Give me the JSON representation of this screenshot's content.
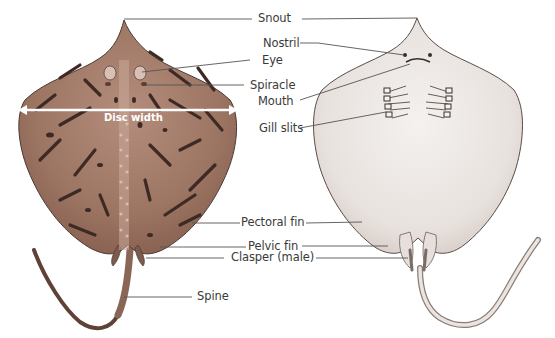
{
  "diagram": {
    "views": [
      "dorsal view",
      "ventral view"
    ],
    "colors": {
      "dorsal_skin": "#9c7563",
      "dorsal_skin_light": "#b99483",
      "dorsal_spots": "#3d2a24",
      "ventral_skin": "#ece7e4",
      "ventral_shade": "#d8cfca",
      "outline": "#4a3a34",
      "leader_line": "#555555",
      "label_text": "#3a3a3a",
      "disc_arrow": "#ffffff"
    },
    "labels": {
      "snout": "Snout",
      "nostril": "Nostril",
      "eye": "Eye",
      "spiracle": "Spiracle",
      "mouth": "Mouth",
      "disc_width": "Disc width",
      "gill_slits": "Gill slits",
      "pectoral_fin": "Pectoral fin",
      "pelvic_fin": "Pelvic fin",
      "clasper": "Clasper (male)",
      "spine": "Spine"
    }
  }
}
